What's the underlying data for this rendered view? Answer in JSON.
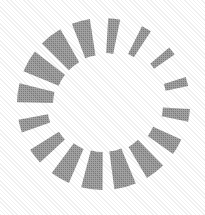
{
  "image": {
    "kind": "loading-spinner-icon",
    "title": "Loading spinner",
    "width": 205,
    "height": 215,
    "background_color": "#ffffff",
    "rendering": "halftone-dithered-grayscale"
  },
  "spinner": {
    "segment_color": "#7d7d7d",
    "segment_count": 16,
    "center_x": 103,
    "center_y": 104,
    "outer_radius": 86,
    "inner_radius": 48,
    "gap_degrees": 9,
    "segments": [
      {
        "index": 0,
        "angle_deg": -82.5,
        "outer_radius": 86,
        "inner_radius": 51,
        "half_width_deg": 4.0,
        "thickness": "thin"
      },
      {
        "index": 1,
        "angle_deg": -60.0,
        "outer_radius": 87,
        "inner_radius": 56,
        "half_width_deg": 3.4,
        "thickness": "thin"
      },
      {
        "index": 2,
        "angle_deg": -37.5,
        "outer_radius": 87,
        "inner_radius": 62,
        "half_width_deg": 2.9,
        "thickness": "thinnest"
      },
      {
        "index": 3,
        "angle_deg": -15.0,
        "outer_radius": 87,
        "inner_radius": 64,
        "half_width_deg": 3.1,
        "thickness": "thinnest"
      },
      {
        "index": 4,
        "angle_deg": 7.5,
        "outer_radius": 87,
        "inner_radius": 60,
        "half_width_deg": 4.2,
        "thickness": "thin"
      },
      {
        "index": 5,
        "angle_deg": 30.0,
        "outer_radius": 86,
        "inner_radius": 55,
        "half_width_deg": 5.6,
        "thickness": "medium"
      },
      {
        "index": 6,
        "angle_deg": 52.5,
        "outer_radius": 86,
        "inner_radius": 50,
        "half_width_deg": 6.8,
        "thickness": "medium"
      },
      {
        "index": 7,
        "angle_deg": 75.0,
        "outer_radius": 86,
        "inner_radius": 48,
        "half_width_deg": 7.4,
        "thickness": "thick"
      },
      {
        "index": 8,
        "angle_deg": 97.5,
        "outer_radius": 86,
        "inner_radius": 48,
        "half_width_deg": 7.2,
        "thickness": "thick"
      },
      {
        "index": 9,
        "angle_deg": 120.0,
        "outer_radius": 86,
        "inner_radius": 49,
        "half_width_deg": 6.6,
        "thickness": "medium"
      },
      {
        "index": 10,
        "angle_deg": 142.5,
        "outer_radius": 86,
        "inner_radius": 52,
        "half_width_deg": 5.4,
        "thickness": "medium"
      },
      {
        "index": 11,
        "angle_deg": 165.0,
        "outer_radius": 86,
        "inner_radius": 56,
        "half_width_deg": 4.4,
        "thickness": "thin"
      },
      {
        "index": 12,
        "angle_deg": 187.5,
        "outer_radius": 86,
        "inner_radius": 50,
        "half_width_deg": 6.4,
        "thickness": "medium"
      },
      {
        "index": 13,
        "angle_deg": 210.0,
        "outer_radius": 86,
        "inner_radius": 48,
        "half_width_deg": 7.6,
        "thickness": "thick"
      },
      {
        "index": 14,
        "angle_deg": 232.5,
        "outer_radius": 86,
        "inner_radius": 48,
        "half_width_deg": 7.8,
        "thickness": "thick"
      },
      {
        "index": 15,
        "angle_deg": 255.0,
        "outer_radius": 86,
        "inner_radius": 49,
        "half_width_deg": 6.2,
        "thickness": "medium"
      }
    ]
  }
}
